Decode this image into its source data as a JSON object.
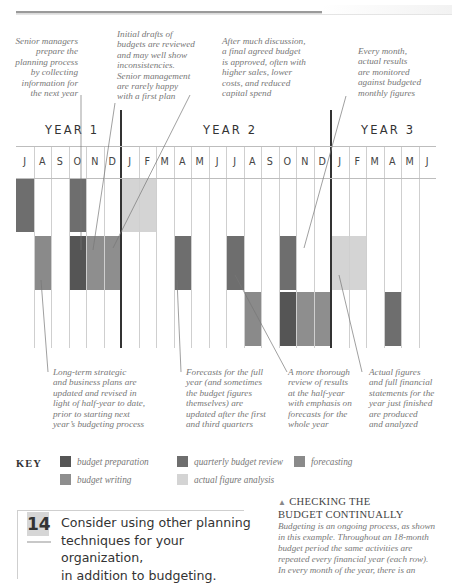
{
  "colors": {
    "budget_preparation": "#555555",
    "quarterly_budget_review": "#6e6e6e",
    "forecasting": "#8a8a8a",
    "budget_writing": "#8e8e8e",
    "actual_figure_analysis": "#d4d4d4"
  },
  "top_notes": [
    {
      "id": "senior-managers",
      "text": "Senior managers\nprepare the\nplanning process\nby collecting\ninformation for\nthe next year"
    },
    {
      "id": "initial-drafts",
      "text": "Initial drafts of\nbudgets are reviewed\nand may well show\ninconsistencies.\nSenior management\nare rarely happy\nwith a first plan"
    },
    {
      "id": "final-budget",
      "text": "After much discussion,\na final agreed budget\nis approved, often with\nhigher sales, lower\ncosts, and reduced\ncapital spend"
    },
    {
      "id": "every-month",
      "text": "Every month,\nactual results\nare monitored\nagainst budgeted\nmonthly figures"
    }
  ],
  "bottom_notes": [
    {
      "id": "long-term",
      "text": "Long-term strategic\nand business plans are\nupdated and revised in\nlight of half-year to date,\nprior to starting next\nyear’s budgeting process"
    },
    {
      "id": "forecasts",
      "text": "Forecasts for the full\nyear (and sometimes\nthe budget figures\nthemselves) are\nupdated after the first\nand third quarters"
    },
    {
      "id": "thorough-review",
      "text": "A more thorough\nreview of results\nat the half-year\nwith emphasis on\nforecasts for the\nwhole year"
    },
    {
      "id": "actual-figures",
      "text": "Actual figures\nand full financial\nstatements for the\nyear just finished\nare produced\nand analyzed"
    }
  ],
  "years": [
    "YEAR 1",
    "YEAR 2",
    "YEAR 3"
  ],
  "months": [
    "J",
    "A",
    "S",
    "O",
    "N",
    "D",
    "J",
    "F",
    "M",
    "A",
    "M",
    "J",
    "J",
    "A",
    "S",
    "O",
    "N",
    "D",
    "J",
    "F",
    "M",
    "A",
    "M",
    "J"
  ],
  "chart_data": {
    "type": "table",
    "columns": [
      "J",
      "A",
      "S",
      "O",
      "N",
      "D",
      "J",
      "F",
      "M",
      "A",
      "M",
      "J",
      "J",
      "A",
      "S",
      "O",
      "N",
      "D",
      "J",
      "F",
      "M",
      "A",
      "M",
      "J"
    ],
    "year_groups": [
      {
        "label": "YEAR 1",
        "start_col": 0,
        "end_col": 5
      },
      {
        "label": "YEAR 2",
        "start_col": 6,
        "end_col": 17
      },
      {
        "label": "YEAR 3",
        "start_col": 18,
        "end_col": 23
      }
    ],
    "rows": [
      {
        "row": 1,
        "cells": [
          {
            "col": 0,
            "activity": "quarterly budget review"
          },
          {
            "col": 3,
            "activity": "quarterly budget review"
          },
          {
            "col": 6,
            "activity": "actual figure analysis"
          },
          {
            "col": 7,
            "activity": "actual figure analysis"
          }
        ]
      },
      {
        "row": 2,
        "cells": [
          {
            "col": 1,
            "activity": "forecasting"
          },
          {
            "col": 3,
            "activity": "budget preparation"
          },
          {
            "col": 4,
            "activity": "budget writing"
          },
          {
            "col": 5,
            "activity": "budget writing"
          },
          {
            "col": 9,
            "activity": "quarterly budget review"
          },
          {
            "col": 12,
            "activity": "quarterly budget review"
          },
          {
            "col": 15,
            "activity": "quarterly budget review"
          },
          {
            "col": 18,
            "activity": "actual figure analysis"
          },
          {
            "col": 19,
            "activity": "actual figure analysis"
          }
        ]
      },
      {
        "row": 3,
        "cells": [
          {
            "col": 13,
            "activity": "forecasting"
          },
          {
            "col": 15,
            "activity": "budget preparation"
          },
          {
            "col": 16,
            "activity": "budget writing"
          },
          {
            "col": 17,
            "activity": "budget writing"
          },
          {
            "col": 21,
            "activity": "quarterly budget review"
          }
        ]
      }
    ],
    "legend": [
      "budget preparation",
      "quarterly budget review",
      "forecasting",
      "budget writing",
      "actual figure analysis"
    ]
  },
  "key": {
    "label": "KEY",
    "items": [
      {
        "id": "budget-preparation",
        "label": "budget preparation",
        "color": "#555555"
      },
      {
        "id": "quarterly-budget-review",
        "label": "quarterly budget review",
        "color": "#6e6e6e"
      },
      {
        "id": "forecasting",
        "label": "forecasting",
        "color": "#8a8a8a"
      },
      {
        "id": "budget-writing",
        "label": "budget writing",
        "color": "#8e8e8e"
      },
      {
        "id": "actual-figure-analysis",
        "label": "actual figure analysis",
        "color": "#d4d4d4"
      }
    ]
  },
  "tip": {
    "number": "14",
    "text": "Consider using other planning\ntechniques for your organization,\nin addition to budgeting."
  },
  "caption": {
    "triangle": "▲",
    "heading": "CHECKING THE\nBUDGET CONTINUALLY",
    "body": "Budgeting is an ongoing process, as shown\nin this example. Throughout an 18-month\nbudget period the same activities are\nrepeated every financial year (each row).\nIn every month of the year, there is an"
  }
}
